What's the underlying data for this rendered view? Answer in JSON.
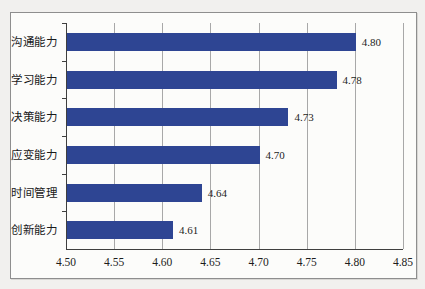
{
  "chart_data": {
    "type": "bar",
    "orientation": "horizontal",
    "title": "",
    "xlabel": "",
    "ylabel": "",
    "categories": [
      "沟通能力",
      "学习能力",
      "决策能力",
      "应变能力",
      "时间管理",
      "创新能力"
    ],
    "values": [
      4.8,
      4.78,
      4.73,
      4.7,
      4.64,
      4.61
    ],
    "value_labels": [
      "4.80",
      "4.78",
      "4.73",
      "4.70",
      "4.64",
      "4.61"
    ],
    "xlim": [
      4.5,
      4.85
    ],
    "x_tick_step": 0.05,
    "x_tick_labels": [
      "4.50",
      "4.55",
      "4.60",
      "4.65",
      "4.70",
      "4.75",
      "4.80",
      "4.85"
    ],
    "grid": true,
    "legend_position": "none",
    "colors": {
      "bar": "#2E4593",
      "gridline": "#a8a8a8",
      "axis": "#3f3f3f",
      "frame_border": "#8e8e8e",
      "frame_background": "#fcfcfa",
      "page_background": "#f1f0ee",
      "text": "#1c1c1c"
    }
  }
}
